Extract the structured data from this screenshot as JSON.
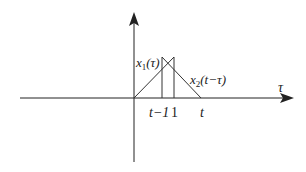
{
  "diagram": {
    "axis_label_x": "τ",
    "x1_label": "x",
    "x1_sub": "1",
    "x1_arg": "(τ)",
    "x2_label": "x",
    "x2_sub": "2",
    "x2_arg": "(t−τ)",
    "tick_t_minus_1": "t−1",
    "tick_1": "1",
    "tick_t": "t",
    "colors": {
      "line": "#333333",
      "axis": "#222222"
    }
  }
}
